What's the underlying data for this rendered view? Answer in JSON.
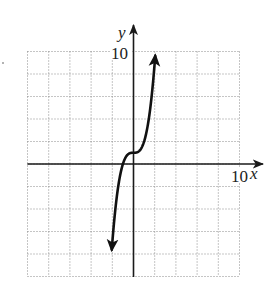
{
  "chart_data": {
    "type": "line",
    "title": "",
    "function": "y = x^3 + 1",
    "xlabel": "x",
    "ylabel": "y",
    "xlim": [
      -10,
      10
    ],
    "ylim": [
      -10,
      10
    ],
    "grid": true,
    "grid_style": "dotted",
    "grid_step": 2,
    "tick_labels": {
      "x": [
        "10"
      ],
      "y": [
        "10"
      ]
    },
    "series": [
      {
        "name": "curve",
        "arrows": "both ends",
        "x": [
          -2.05,
          -2.0,
          -1.8,
          -1.6,
          -1.4,
          -1.2,
          -1.0,
          -0.8,
          -0.6,
          -0.4,
          -0.2,
          0.0,
          0.2,
          0.4,
          0.6,
          0.8,
          1.0,
          1.2,
          1.4,
          1.6,
          1.8,
          2.0,
          2.05
        ],
        "y": [
          -7.62,
          -7.0,
          -4.83,
          -3.1,
          -1.74,
          -0.73,
          0.0,
          0.49,
          0.78,
          0.94,
          0.99,
          1.0,
          1.01,
          1.06,
          1.22,
          1.51,
          2.0,
          2.73,
          3.74,
          5.1,
          6.83,
          9.0,
          9.62
        ]
      }
    ],
    "legend": null
  },
  "labels": {
    "y_axis": "y",
    "x_axis": "x",
    "y_tick_top": "10",
    "x_tick_right": "10"
  },
  "colors": {
    "grid": "#8a8a8a",
    "axis": "#1a1a1a",
    "curve": "#111111",
    "background": "#ffffff"
  }
}
